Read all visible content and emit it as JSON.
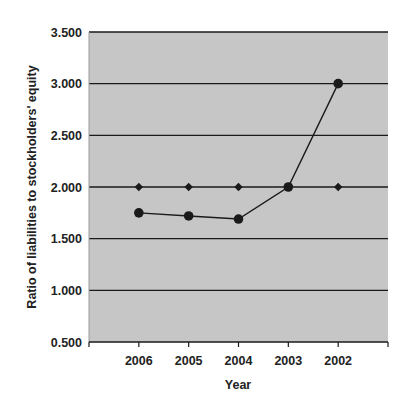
{
  "chart_data": {
    "type": "line",
    "title": "",
    "xlabel": "Year",
    "ylabel": "Ratio of liabilities to stockholders' equity",
    "categories": [
      "2006",
      "2005",
      "2004",
      "2003",
      "2002"
    ],
    "series": [
      {
        "name": "Ratio (circle markers)",
        "marker": "circle",
        "line": true,
        "values": [
          1.75,
          1.72,
          1.69,
          2.0,
          3.0
        ]
      },
      {
        "name": "Benchmark (diamond markers)",
        "marker": "diamond",
        "line": false,
        "values": [
          2.0,
          2.0,
          2.0,
          2.0,
          2.0
        ]
      }
    ],
    "ylim": [
      0.5,
      3.5
    ],
    "yticks": [
      "0.500",
      "1.000",
      "1.500",
      "2.000",
      "2.500",
      "3.000",
      "3.500"
    ],
    "ytick_values": [
      0.5,
      1.0,
      1.5,
      2.0,
      2.5,
      3.0,
      3.5
    ],
    "grid": "horizontal",
    "legend": "none",
    "colors": {
      "plot_background": "#c6c6c6",
      "gridline": "#1a1a1a",
      "series": "#1a1a1a"
    }
  }
}
